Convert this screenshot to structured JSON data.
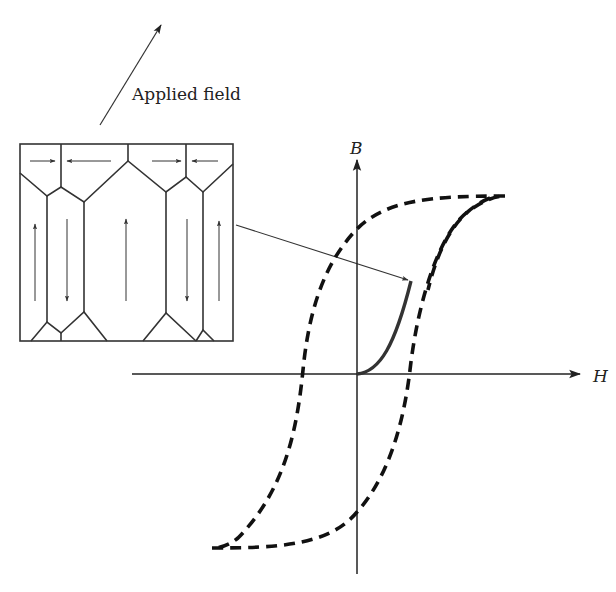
{
  "labels": {
    "applied_field": "Applied field",
    "b_axis": "B",
    "h_axis": "H"
  },
  "colors": {
    "ink": "#222222",
    "curve": "#111111",
    "initial_curve": "#333333",
    "background": "#ffffff"
  },
  "domain_box": {
    "domains": [
      {
        "position": "top-left-1",
        "direction": "right"
      },
      {
        "position": "top-left-2",
        "direction": "left"
      },
      {
        "position": "top-right-1",
        "direction": "right"
      },
      {
        "position": "top-right-2",
        "direction": "left"
      },
      {
        "position": "column-1",
        "direction": "up"
      },
      {
        "position": "column-2",
        "direction": "down"
      },
      {
        "position": "column-3",
        "direction": "up"
      },
      {
        "position": "column-4",
        "direction": "down"
      },
      {
        "position": "column-5",
        "direction": "up"
      }
    ]
  },
  "plot": {
    "type": "hysteresis loop",
    "loop_style": "dashed",
    "initial_magnetization_style": "solid"
  }
}
